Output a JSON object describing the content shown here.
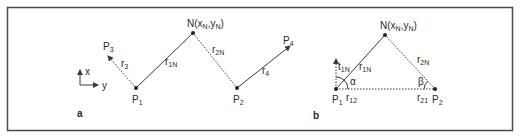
{
  "figure": {
    "panels": [
      {
        "id": "a",
        "label": "a",
        "axes": {
          "x_label": "x",
          "y_label": "y"
        },
        "points": {
          "P1": {
            "base": "P",
            "sub": "1"
          },
          "P2": {
            "base": "P",
            "sub": "2"
          },
          "P3": {
            "base": "P",
            "sub": "3"
          },
          "P4": {
            "base": "P",
            "sub": "4"
          },
          "N": {
            "text": "N(x",
            "sub1": "N",
            "mid": ",y",
            "sub2": "N",
            "end": ")"
          }
        },
        "edges": {
          "r3": {
            "base": "r",
            "sub": "3",
            "style": "dotted"
          },
          "r1N": {
            "base": "r",
            "sub": "1N",
            "style": "solid"
          },
          "r2N": {
            "base": "r",
            "sub": "2N",
            "style": "dotted"
          },
          "r4": {
            "base": "r",
            "sub": "4",
            "style": "solid"
          }
        }
      },
      {
        "id": "b",
        "label": "b",
        "points": {
          "P1": {
            "base": "P",
            "sub": "1"
          },
          "P2": {
            "base": "P",
            "sub": "2"
          },
          "N": {
            "text": "N(x",
            "sub1": "N",
            "mid": ",y",
            "sub2": "N",
            "end": ")"
          }
        },
        "edges": {
          "t1N": {
            "base": "t",
            "sub": "1N",
            "style": "dotted-arrow"
          },
          "r1N": {
            "base": "r",
            "sub": "1N",
            "style": "solid"
          },
          "r2N": {
            "base": "r",
            "sub": "2N",
            "style": "dotted"
          },
          "r12": {
            "base": "r",
            "sub": "12",
            "style": "dotted"
          },
          "r21": {
            "base": "r",
            "sub": "21",
            "style": "dotted"
          }
        },
        "angles": {
          "alpha": "α",
          "beta": "β"
        }
      }
    ]
  }
}
